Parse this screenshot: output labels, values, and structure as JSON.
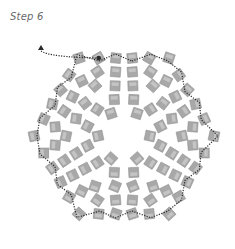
{
  "title": "Step 6",
  "colors": {
    "bead_fill": "#a8a8a8",
    "bead_stroke": "#8a8a8a",
    "bead_highlight": "#c4c4c4",
    "thread": "#2a2a2a",
    "background": "#ffffff"
  },
  "diagram": {
    "center": [
      124,
      136
    ],
    "rings": [
      {
        "radius": 26,
        "count": 6,
        "offset": 30,
        "size": 10
      },
      {
        "radius": 42,
        "count": 12,
        "offset": 15,
        "size": 10
      },
      {
        "radius": 58,
        "count": 18,
        "offset": 10,
        "size": 10
      },
      {
        "radius": 74,
        "count": 24,
        "offset": 7.5,
        "size": 10
      },
      {
        "radius": 90,
        "count": 30,
        "offset": 6,
        "size": 10
      }
    ],
    "thread_start": [
      41,
      47
    ],
    "thread_arrow": "up"
  }
}
